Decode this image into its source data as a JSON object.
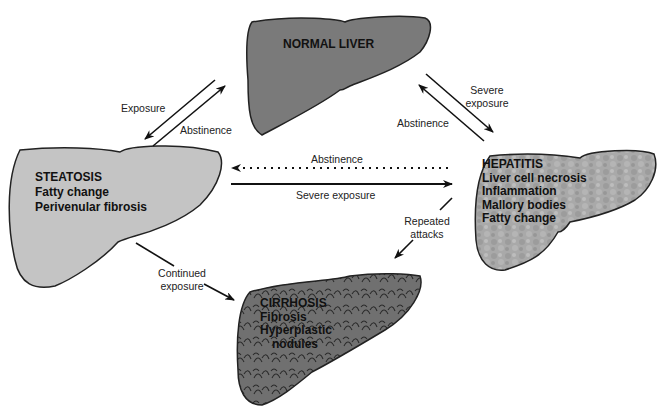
{
  "colors": {
    "normal_liver": "#7a7a7a",
    "steatosis": "#c4c4c4",
    "hepatitis": "#a8a8a8",
    "cirrhosis": "#6e6e6e",
    "arrow": "#111111"
  },
  "nodes": {
    "normal": {
      "title": "NORMAL LIVER"
    },
    "steatosis": {
      "title": "STEATOSIS",
      "lines": [
        "Fatty change",
        "Perivenular fibrosis"
      ]
    },
    "hepatitis": {
      "title": "HEPATITIS",
      "lines": [
        "Liver cell necrosis",
        "Inflammation",
        "Mallory bodies",
        "Fatty change"
      ]
    },
    "cirrhosis": {
      "title": "CIRRHOSIS",
      "lines": [
        "Fibrosis",
        "Hyperplastic",
        "nodules"
      ]
    }
  },
  "edges": {
    "normal_to_steatosis": "Exposure",
    "steatosis_to_normal": "Abstinence",
    "normal_to_hepatitis_1": "Severe",
    "normal_to_hepatitis_2": "exposure",
    "hepatitis_to_normal": "Abstinence",
    "hepatitis_to_steatosis": "Abstinence",
    "steatosis_to_hepatitis": "Severe exposure",
    "hepatitis_to_cirrhosis_1": "Repeated",
    "hepatitis_to_cirrhosis_2": "attacks",
    "steatosis_to_cirrhosis_1": "Continued",
    "steatosis_to_cirrhosis_2": "exposure"
  }
}
